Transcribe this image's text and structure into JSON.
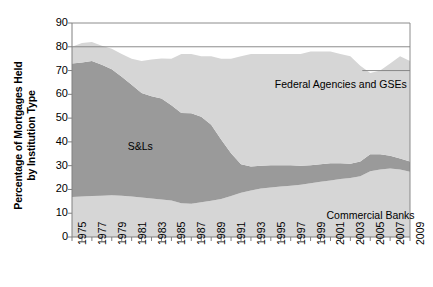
{
  "chart_data": {
    "type": "area",
    "title": "",
    "xlabel": "",
    "ylabel": "Percentage of Mortgages Held by Institution Type",
    "ylabel_line1": "Percentage of Mortgages Held",
    "ylabel_line2": "by Institution Type",
    "ylim": [
      0,
      90
    ],
    "xlim": [
      1975,
      2009
    ],
    "y_ticks": [
      90,
      80,
      70,
      60,
      50,
      40,
      30,
      20,
      10,
      0
    ],
    "x_ticks": [
      1975,
      1976,
      1977,
      1978,
      1979,
      1980,
      1981,
      1982,
      1983,
      1984,
      1985,
      1986,
      1987,
      1988,
      1989,
      1990,
      1991,
      1992,
      1993,
      1994,
      1995,
      1996,
      1997,
      1998,
      1999,
      2000,
      2001,
      2002,
      2003,
      2004,
      2005,
      2006,
      2007,
      2008,
      2009
    ],
    "x_tick_labels": [
      "1975",
      "1977",
      "1979",
      "1981",
      "1983",
      "1985",
      "1987",
      "1989",
      "1991",
      "1993",
      "1995",
      "1997",
      "1999",
      "2001",
      "2003",
      "2005",
      "2007",
      "2009"
    ],
    "grid": "horizontal gridlines at 80 and 90 (top border); partial line at 70 on right",
    "legend_position": "inline-annotations",
    "stacked": true,
    "x": [
      1975,
      1976,
      1977,
      1978,
      1979,
      1980,
      1981,
      1982,
      1983,
      1984,
      1985,
      1986,
      1987,
      1988,
      1989,
      1990,
      1991,
      1992,
      1993,
      1994,
      1995,
      1996,
      1997,
      1998,
      1999,
      2000,
      2001,
      2002,
      2003,
      2004,
      2005,
      2006,
      2007,
      2008,
      2009
    ],
    "series": [
      {
        "name": "Commercial Banks",
        "color": "#d6d6d6",
        "values": [
          16.8,
          17.0,
          17.2,
          17.4,
          17.6,
          17.4,
          17.0,
          16.6,
          16.2,
          15.8,
          15.4,
          14.2,
          14.0,
          14.6,
          15.2,
          16.0,
          17.2,
          18.6,
          19.6,
          20.4,
          20.8,
          21.2,
          21.6,
          22.0,
          22.6,
          23.2,
          23.8,
          24.4,
          24.8,
          25.6,
          27.6,
          28.4,
          28.8,
          28.4,
          27.4
        ]
      },
      {
        "name": "S&Ls",
        "color": "#9a9a9a",
        "values": [
          56.2,
          56.4,
          56.8,
          55.0,
          53.0,
          50.0,
          47.0,
          44.0,
          43.0,
          42.5,
          40.0,
          38.0,
          38.0,
          36.0,
          32.0,
          25.0,
          18.0,
          12.0,
          10.0,
          9.6,
          9.4,
          9.0,
          8.6,
          8.0,
          7.6,
          7.4,
          7.2,
          6.6,
          6.0,
          6.2,
          7.2,
          6.4,
          5.4,
          4.6,
          4.4
        ]
      },
      {
        "name": "Federal Agencies and GSEs",
        "color": "#d6d6d6",
        "values": [
          7.0,
          8.2,
          8.0,
          8.0,
          8.6,
          9.6,
          11.0,
          13.4,
          15.4,
          16.8,
          19.6,
          24.8,
          25.0,
          25.4,
          28.8,
          34.0,
          39.8,
          45.4,
          47.4,
          47.0,
          46.8,
          46.8,
          46.8,
          47.0,
          47.8,
          47.4,
          47.0,
          46.0,
          45.2,
          40.2,
          34.2,
          35.2,
          38.8,
          43.0,
          42.2
        ]
      }
    ],
    "totals": [
      80.0,
      81.6,
      82.0,
      80.4,
      79.2,
      77.0,
      75.0,
      74.0,
      74.6,
      75.1,
      75.0,
      77.0,
      77.0,
      76.0,
      76.0,
      75.0,
      75.0,
      76.0,
      77.0,
      77.0,
      77.0,
      77.0,
      77.0,
      77.0,
      78.0,
      78.0,
      78.0,
      77.0,
      76.0,
      72.0,
      69.0,
      70.0,
      73.0,
      76.0,
      74.0
    ],
    "annotations": [
      {
        "text": "Federal Agencies and GSEs",
        "x": 1997,
        "y": 64
      },
      {
        "text": "S&Ls",
        "x": 1982,
        "y": 38
      },
      {
        "text": "Commercial Banks",
        "x": 2003,
        "y": 9
      }
    ]
  },
  "axis": {
    "y_tick_labels": [
      "90",
      "80",
      "70",
      "60",
      "50",
      "40",
      "30",
      "20",
      "10",
      "0"
    ],
    "x_tick_labels": [
      "1975",
      "1977",
      "1979",
      "1981",
      "1983",
      "1985",
      "1987",
      "1989",
      "1991",
      "1993",
      "1995",
      "1997",
      "1999",
      "2001",
      "2003",
      "2005",
      "2007",
      "2009"
    ]
  },
  "labels": {
    "federal": "Federal Agencies and GSEs",
    "sls": "S&Ls",
    "banks": "Commercial Banks"
  },
  "colors": {
    "band_light": "#d6d6d6",
    "band_dark": "#9a9a9a",
    "axis": "#808080",
    "text": "#000000"
  }
}
